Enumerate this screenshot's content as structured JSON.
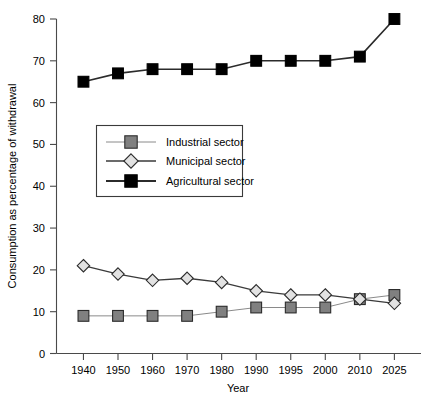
{
  "chart_data": {
    "type": "line",
    "title": "",
    "xlabel": "Year",
    "ylabel": "Consumption as percentage of withdrawal",
    "categories": [
      "1940",
      "1950",
      "1960",
      "1970",
      "1980",
      "1990",
      "1995",
      "2000",
      "2010",
      "2025"
    ],
    "ylim": [
      0,
      80
    ],
    "yticks": [
      0,
      10,
      20,
      30,
      40,
      50,
      60,
      70,
      80
    ],
    "ytick_labels": [
      "0",
      "10",
      "20",
      "30",
      "40",
      "50",
      "60",
      "70",
      "80"
    ],
    "grid": false,
    "legend_position": "center-left",
    "series": [
      {
        "name": "Industrial sector",
        "marker": "square",
        "marker_fill": "#808080",
        "marker_stroke": "#2b2b2b",
        "line_color": "#8a8a8a",
        "values": [
          9,
          9,
          9,
          9,
          10,
          11,
          11,
          11,
          13,
          14
        ]
      },
      {
        "name": "Municipal sector",
        "marker": "diamond",
        "marker_fill": "#e2e2e2",
        "marker_stroke": "#2b2b2b",
        "line_color": "#3a3a3a",
        "values": [
          21,
          19,
          17.5,
          18,
          17,
          15,
          14,
          14,
          13,
          12
        ]
      },
      {
        "name": "Agricultural sector",
        "marker": "square",
        "marker_fill": "#000000",
        "marker_stroke": "#000000",
        "line_color": "#2b2b2b",
        "values": [
          65,
          67,
          68,
          68,
          68,
          70,
          70,
          70,
          71,
          80
        ]
      }
    ]
  },
  "legend": {
    "items": [
      {
        "label": "Industrial sector"
      },
      {
        "label": "Municipal sector"
      },
      {
        "label": "Agricultural sector"
      }
    ]
  },
  "axes": {
    "x_title": "Year",
    "y_title": "Consumption as percentage of withdrawal"
  }
}
